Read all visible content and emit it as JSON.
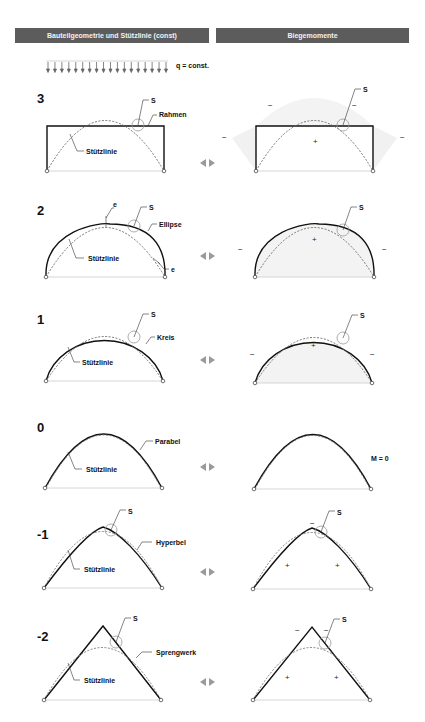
{
  "headers": {
    "left": "Bauteilgeometrie und Stützlinie (const)",
    "right": "Biegemomente"
  },
  "load": {
    "label": "q = const.",
    "arrow_count": 18
  },
  "colors": {
    "header_bg": "#5c5c5c",
    "header_text": "#f2f2f2",
    "member": "#111111",
    "thrust_line": "#666666",
    "moment_fill": "#eeeeee",
    "arrow_icon": "#9a9a9a"
  },
  "common": {
    "thrust_label": "Stützlinie",
    "s_label": "S",
    "arrow_icon": "left-right-arrows-icon"
  },
  "rows": [
    {
      "index": "3",
      "shape": "Rahmen",
      "moment_signs": [
        "−",
        "−",
        "−",
        "−",
        "+"
      ]
    },
    {
      "index": "2",
      "shape": "Ellipse",
      "eccentricity_label": "e",
      "moment_signs": [
        "−",
        "+",
        "−"
      ]
    },
    {
      "index": "1",
      "shape": "Kreis",
      "moment_signs": [
        "−",
        "+",
        "−"
      ]
    },
    {
      "index": "0",
      "shape": "Parabel",
      "moment_note": "M = 0"
    },
    {
      "index": "-1",
      "shape": "Hyperbel",
      "moment_signs": [
        "−",
        "+",
        "+"
      ]
    },
    {
      "index": "-2",
      "shape": "Sprengwerk",
      "moment_signs": [
        "−",
        "−",
        "+",
        "+"
      ]
    }
  ]
}
